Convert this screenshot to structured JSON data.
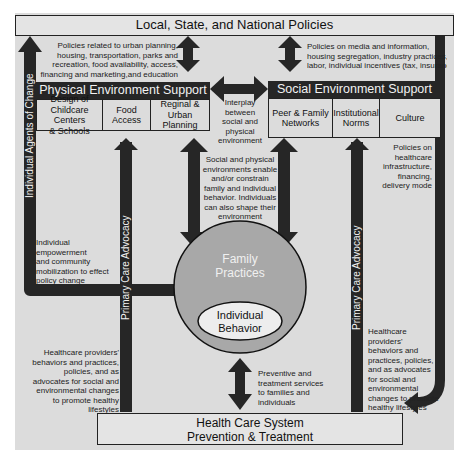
{
  "top_box": {
    "label": "Local, State, and National Policies"
  },
  "policy_notes": {
    "left": [
      "Policies related to urban planning,",
      "housing, transportation, parks and",
      "recreation, food availability, access,",
      "financing and marketing,and education"
    ],
    "right": [
      "Policies on media and information,",
      "housing segregation, industry practices,",
      "labor, individual incentives (tax, insurance)"
    ]
  },
  "physical_env": {
    "title": "Physical Environment Support",
    "cells": [
      {
        "lines": [
          "Design of",
          "Childcare",
          "Centers",
          "& Schools"
        ]
      },
      {
        "lines": [
          "Food",
          "Access"
        ]
      },
      {
        "lines": [
          "Reginal &",
          "Urban",
          "Planning"
        ]
      }
    ]
  },
  "social_env": {
    "title": "Social Environment Support",
    "cells": [
      {
        "lines": [
          "Peer & Family",
          "Networks"
        ]
      },
      {
        "lines": [
          "Institutional",
          "Norms"
        ]
      },
      {
        "lines": [
          "Culture"
        ]
      }
    ]
  },
  "interplay_note": [
    "Interplay",
    "between",
    "social and",
    "physical",
    "environment"
  ],
  "enable_note": [
    "Social and physical",
    "environments enable",
    "and/or constrain",
    "family and individual",
    "behavior. Individuals",
    "can also shape their",
    "environment"
  ],
  "healthcare_policy_note": [
    "Policies on",
    "healthcare",
    "infrastructure,",
    "financing,",
    "delivery mode"
  ],
  "empowerment_note": [
    "Individual",
    "empowerment",
    "and community",
    "mobilization to effect",
    "policy change"
  ],
  "providers_note_left": [
    "Healthcare providers'",
    "behaviors and practices,",
    "policies, and as",
    "advocates for social and",
    "environmental changes",
    "to promote healthy",
    "lifestyles"
  ],
  "providers_note_right": [
    "Healthcare",
    "providers'",
    "behaviors and",
    "practices, policies,",
    "and as advocates",
    "for social and",
    "environmental",
    "changes to promote",
    "healthy lifestyles"
  ],
  "services_note": [
    "Preventive and",
    "treatment services",
    "to families and",
    "individuals"
  ],
  "vertical_labels": {
    "agents": "Individual Agents of Change",
    "advocacy_left": "Primary Care Advocacy",
    "advocacy_right": "Primary Care Advocacy"
  },
  "family_circle": {
    "label_line1": "Family",
    "label_line2": "Practices"
  },
  "individual_ellipse": {
    "label_line1": "Individual",
    "label_line2": "Behavior"
  },
  "bottom_box": {
    "line1": "Health Care System",
    "line2": "Prevention & Treatment"
  },
  "colors": {
    "background": "#dcdcdc",
    "dark": "#262626",
    "circle": "#a8a8a8",
    "ellipse": "#ededed"
  }
}
